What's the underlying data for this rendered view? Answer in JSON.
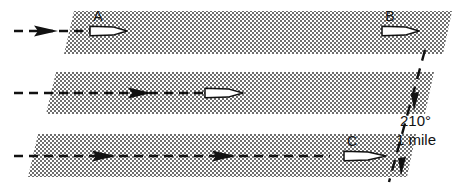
{
  "diagram": {
    "type": "navigation-track-diagram",
    "background_color": "#ffffff",
    "ink_color": "#111111",
    "band_fill_color": "#b9b9b9",
    "bands": [
      {
        "id": "band-top",
        "label": "A",
        "label_text": "A",
        "has_white_aircraft": true,
        "black_aircraft_count": 1
      },
      {
        "id": "band-middle",
        "label": "",
        "label_text": "",
        "has_white_aircraft": true,
        "black_aircraft_count": 1
      },
      {
        "id": "band-bottom",
        "label": "C",
        "label_text": "C",
        "has_white_aircraft": true,
        "black_aircraft_count": 2
      }
    ],
    "top_band_right_label": "B",
    "annotations": {
      "bearing": "210°",
      "distance": "1  mile"
    }
  }
}
